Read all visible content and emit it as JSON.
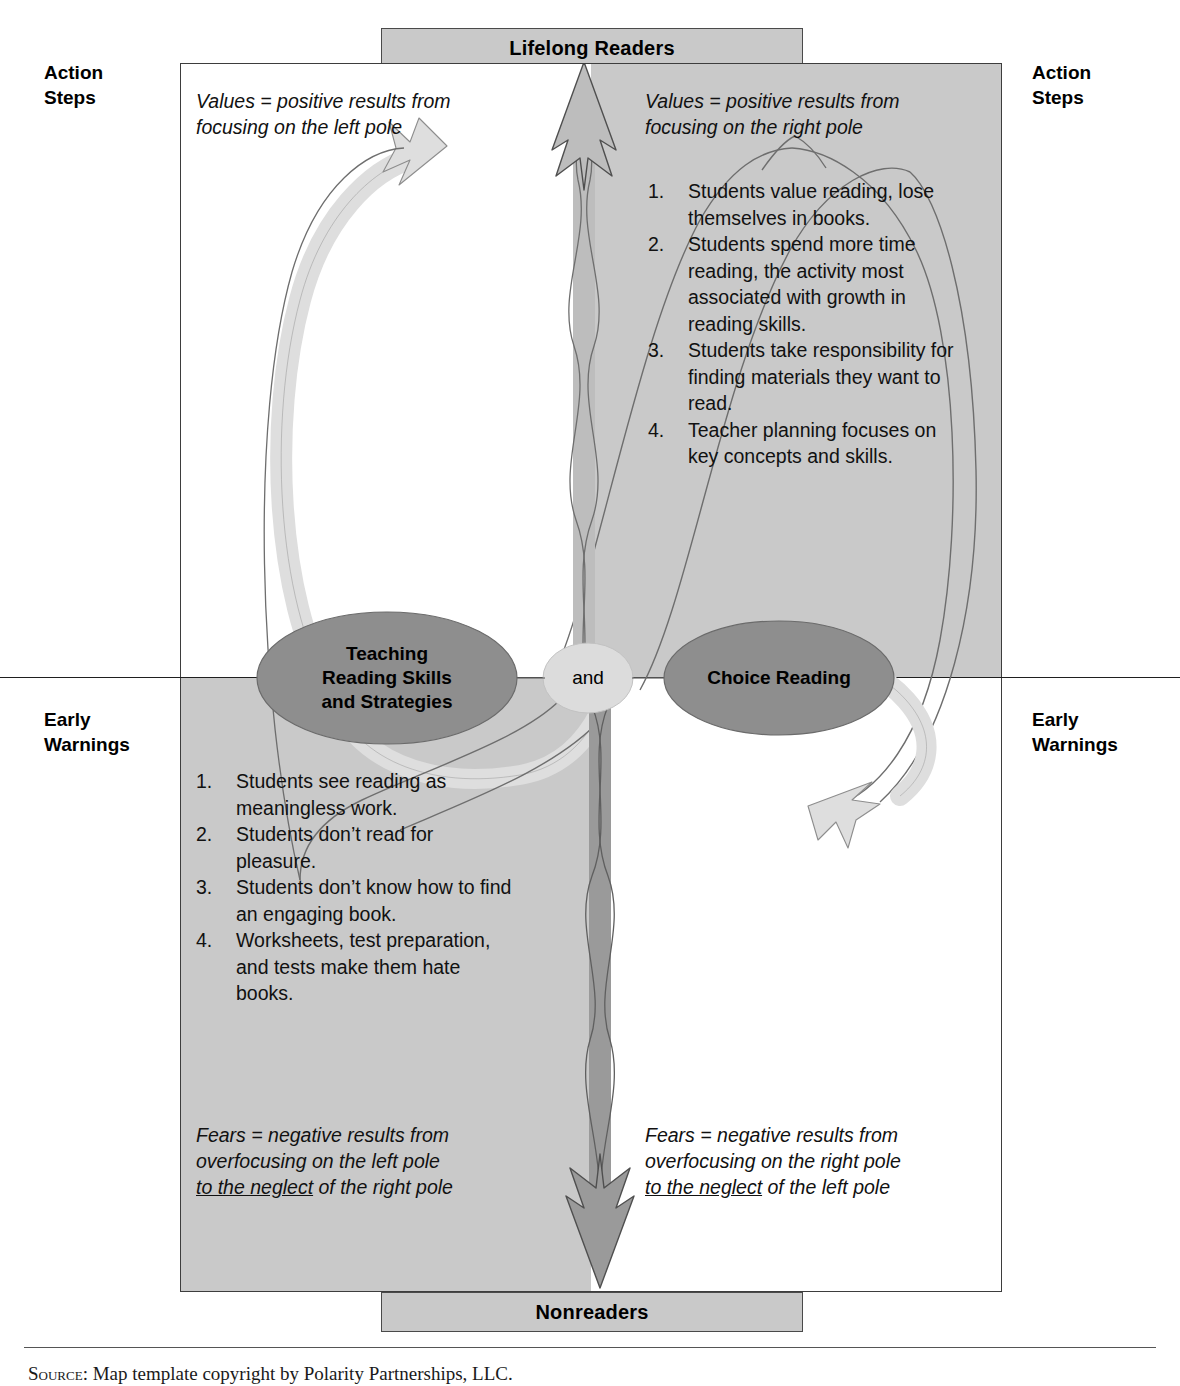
{
  "diagram": {
    "type": "polarity-map",
    "top_pole": "Lifelong Readers",
    "bottom_pole": "Nonreaders",
    "left_pole": "Teaching\nReading Skills\nand Strategies",
    "right_pole": "Choice Reading",
    "connector": "and"
  },
  "side_labels": {
    "action_steps_left": "Action\nSteps",
    "action_steps_right": "Action\nSteps",
    "early_warnings_left": "Early\nWarnings",
    "early_warnings_right": "Early\nWarnings"
  },
  "captions": {
    "values_left_line1": "Values = positive results from",
    "values_left_line2": "focusing on the left pole",
    "values_right_line1": "Values = positive results from",
    "values_right_line2": "focusing on the right pole",
    "fears_left_line1": "Fears = negative results from",
    "fears_left_line2": "overfocusing on the left pole",
    "fears_left_line3_underlined": "to the neglect",
    "fears_left_line3_rest": " of the right pole",
    "fears_right_line1": "Fears = negative results from",
    "fears_right_line2": "overfocusing on the right pole",
    "fears_right_line3_underlined": "to the neglect",
    "fears_right_line3_rest": " of the left pole"
  },
  "upper_right_values": [
    {
      "num": "1.",
      "text": "Students value reading, lose themselves in books."
    },
    {
      "num": "2.",
      "text": "Students spend more time reading, the activity most associated with growth in reading skills."
    },
    {
      "num": "3.",
      "text": "Students take responsibility for finding materials they want to read."
    },
    {
      "num": "4.",
      "text": "Teacher planning focuses on key concepts and skills."
    }
  ],
  "lower_left_fears": [
    {
      "num": "1.",
      "text": "Students see reading as meaningless work."
    },
    {
      "num": "2.",
      "text": "Students don’t read for pleasure."
    },
    {
      "num": "3.",
      "text": "Students don’t know how to find an engaging book."
    },
    {
      "num": "4.",
      "text": "Worksheets, test preparation, and tests make them hate books."
    }
  ],
  "footer": {
    "source_lead": "Source:",
    "source_text": " Map template copyright by Polarity Partnerships, LLC."
  },
  "colors": {
    "quadrant_gray": "#c9c9c9",
    "pole_box_gray": "#c9c9c9",
    "ellipse_gray": "#8e8e8e",
    "and_circle_gray": "#dcdcdc",
    "loop_light": "#dedede",
    "arrow_up_gray": "#bdbdbd",
    "arrow_down_gray": "#9a9a9a",
    "outline": "#3d3d3d",
    "text": "#111111"
  }
}
